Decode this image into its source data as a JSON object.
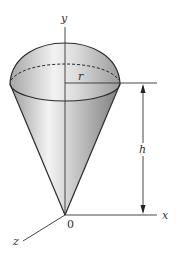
{
  "figure": {
    "labels": {
      "y_axis": "y",
      "x_axis": "x",
      "z_axis": "z",
      "origin": "0",
      "radius": "r",
      "height": "h"
    },
    "colors": {
      "outline": "#2a2a2a",
      "shade_dark": "#8c8c8c",
      "shade_light": "#f2f2f2",
      "axis": "#333333"
    }
  }
}
